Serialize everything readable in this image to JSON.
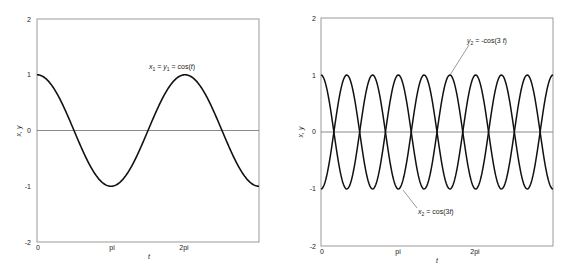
{
  "chart_data": [
    {
      "type": "line",
      "title": "",
      "xlabel": "t",
      "ylabel": "x, y",
      "xlim": [
        0,
        9.4248
      ],
      "ylim": [
        -2,
        2
      ],
      "xticks": [
        0,
        3.1416,
        6.2832
      ],
      "xtick_labels": [
        "0",
        "pi",
        "2pi"
      ],
      "yticks": [
        -2,
        -1,
        0,
        1,
        2
      ],
      "ytick_labels": [
        "-2",
        "-1",
        "0",
        "1",
        "2"
      ],
      "grid": false,
      "zero_line": true,
      "series": [
        {
          "name": "x1 = y1 = cos(t)",
          "function": "cos(t)",
          "x": [
            0,
            1.5708,
            3.1416,
            4.7124,
            6.2832,
            7.854,
            9.4248
          ],
          "values": [
            1,
            0,
            -1,
            0,
            1,
            0,
            -1
          ]
        }
      ],
      "annotations": [
        {
          "text_parts": [
            "x",
            "1",
            " = ",
            "y",
            "1",
            " = cos(",
            "t",
            ")"
          ],
          "label": "x1 = y1 = cos(t)"
        }
      ]
    },
    {
      "type": "line",
      "title": "",
      "xlabel": "t",
      "ylabel": "x, y",
      "xlim": [
        0,
        9.4248
      ],
      "ylim": [
        -2,
        2
      ],
      "xticks": [
        0,
        3.1416,
        6.2832
      ],
      "xtick_labels": [
        "0",
        "pi",
        "2pi"
      ],
      "yticks": [
        -2,
        -1,
        0,
        1,
        2
      ],
      "ytick_labels": [
        "-2",
        "-1",
        "0",
        "1",
        "2"
      ],
      "grid": false,
      "zero_line": true,
      "series": [
        {
          "name": "x2 = cos(3t)",
          "function": "cos(3t)",
          "x": [
            0,
            1.0472,
            2.0944,
            3.1416,
            4.1888,
            5.236,
            6.2832,
            7.3304,
            8.3776,
            9.4248
          ],
          "values": [
            1,
            -1,
            1,
            -1,
            1,
            -1,
            1,
            -1,
            1,
            -1
          ]
        },
        {
          "name": "y2 = -cos(3t)",
          "function": "-cos(3t)",
          "x": [
            0,
            1.0472,
            2.0944,
            3.1416,
            4.1888,
            5.236,
            6.2832,
            7.3304,
            8.3776,
            9.4248
          ],
          "values": [
            -1,
            1,
            -1,
            1,
            -1,
            1,
            -1,
            1,
            -1,
            1
          ]
        }
      ],
      "annotations": [
        {
          "label": "y2 = -cos(3 t)"
        },
        {
          "label": "x2 = cos(3t)"
        }
      ]
    }
  ],
  "plots": [
    {
      "ylabel": "x, y",
      "xlabel": "t",
      "yticks": [
        "2",
        "1",
        "0",
        "-1",
        "-2"
      ],
      "xticks": [
        "0",
        "pi",
        "2pi"
      ],
      "annotation": {
        "a": "x",
        "a_sub": "1",
        "eq1": " = ",
        "b": "y",
        "b_sub": "1",
        "eq2": " = cos(",
        "c": "t",
        "end": ")"
      }
    },
    {
      "ylabel": "x, y",
      "xlabel": "t",
      "yticks": [
        "2",
        "1",
        "0",
        "-1",
        "-2"
      ],
      "xticks": [
        "0",
        "pi",
        "2pi"
      ],
      "annotation_top": {
        "a": "y",
        "a_sub": "2",
        "rest": " = -cos(3 ",
        "c": "t",
        "end": ")"
      },
      "annotation_bottom": {
        "a": "x",
        "a_sub": "2",
        "rest": " = cos(3",
        "c": "t",
        "end": ")"
      }
    }
  ],
  "colors": {
    "curve": "#111111",
    "axis": "#9a9a9a",
    "zero_line": "#8a8a8a",
    "text": "#222222"
  }
}
